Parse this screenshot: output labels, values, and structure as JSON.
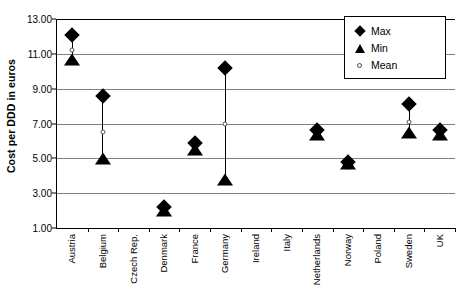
{
  "chart_data": {
    "type": "scatter",
    "title": "",
    "xlabel": "",
    "ylabel": "Cost per DDD in euros",
    "ylim": [
      1.0,
      13.0
    ],
    "ytick_values": [
      13.0,
      11.0,
      9.0,
      7.0,
      5.0,
      3.0,
      1.0
    ],
    "ytick_labels": [
      "13.00",
      "11.00",
      "9.00",
      "7.00",
      "5.00",
      "3.00",
      "1.00"
    ],
    "grid": true,
    "legend_position": "top-right",
    "categories": [
      "Austria",
      "Belgium",
      "Czech Rep.",
      "Denmark",
      "France",
      "Germany",
      "Ireland",
      "Italy",
      "Netherlands",
      "Norway",
      "Poland",
      "Sweden",
      "UK"
    ],
    "series": [
      {
        "name": "Max",
        "marker": "filled-diamond",
        "values": [
          12.1,
          8.6,
          null,
          2.2,
          5.9,
          10.2,
          null,
          null,
          6.6,
          4.8,
          null,
          8.1,
          6.6
        ]
      },
      {
        "name": "Min",
        "marker": "filled-triangle",
        "values": [
          10.6,
          4.9,
          null,
          1.9,
          5.4,
          3.7,
          null,
          null,
          6.3,
          4.6,
          null,
          6.4,
          6.3
        ]
      },
      {
        "name": "Mean",
        "marker": "open-circle",
        "values": [
          11.2,
          6.5,
          null,
          null,
          null,
          7.0,
          null,
          null,
          null,
          null,
          null,
          7.1,
          null
        ]
      }
    ]
  },
  "legend": {
    "items": [
      {
        "label": "Max",
        "marker": "filled-diamond"
      },
      {
        "label": "Min",
        "marker": "filled-triangle"
      },
      {
        "label": "Mean",
        "marker": "open-circle"
      }
    ]
  },
  "colors": {
    "marker": "#000000",
    "gridline": "#808080",
    "axis": "#000000",
    "background": "#ffffff"
  }
}
